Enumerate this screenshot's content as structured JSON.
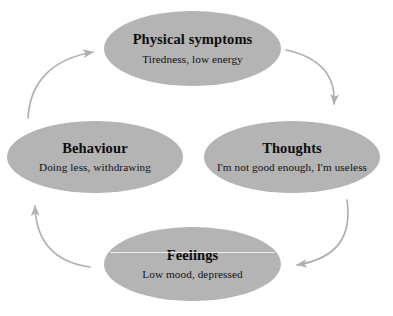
{
  "diagram": {
    "type": "cycle",
    "direction": "clockwise",
    "node_fill_color": "#b4b4b4",
    "arrow_color": "#b0b0b0",
    "background_color": "#ffffff",
    "nodes": [
      {
        "id": "physical",
        "title": "Physical symptoms",
        "subtitle": "Tiredness, low energy",
        "position": "top"
      },
      {
        "id": "thoughts",
        "title": "Thoughts",
        "subtitle": "I'm not good enough, I'm useless",
        "position": "right"
      },
      {
        "id": "feelings",
        "title": "Feelings",
        "subtitle": "Low mood, depressed",
        "position": "bottom"
      },
      {
        "id": "behaviour",
        "title": "Behaviour",
        "subtitle": "Doing less, withdrawing",
        "position": "left"
      }
    ],
    "arrows": [
      {
        "id": "physical-to-thoughts",
        "from": "physical",
        "to": "thoughts"
      },
      {
        "id": "thoughts-to-feelings",
        "from": "thoughts",
        "to": "feelings"
      },
      {
        "id": "feelings-to-behaviour",
        "from": "feelings",
        "to": "behaviour"
      },
      {
        "id": "behaviour-to-physical",
        "from": "behaviour",
        "to": "physical"
      }
    ]
  }
}
